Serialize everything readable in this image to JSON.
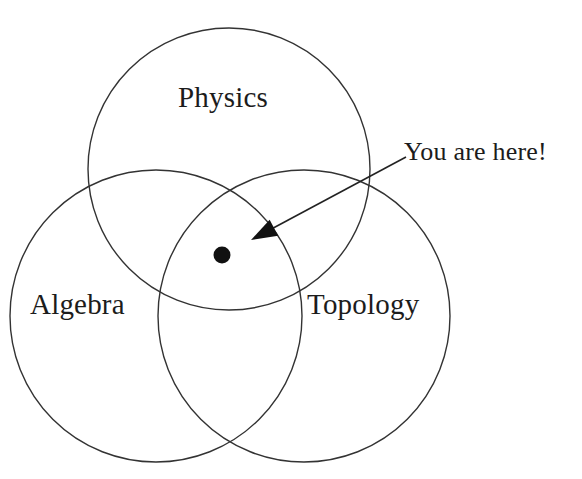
{
  "figure": {
    "type": "venn-diagram",
    "background_color": "#ffffff",
    "stroke_color": "#333333",
    "text_color": "#1c1c1c",
    "width": 582,
    "height": 479
  },
  "top_clipped_text": "",
  "circles": [
    {
      "id": "physics",
      "label": "Physics",
      "cx": 229,
      "cy": 169,
      "r": 141,
      "label_x": 178,
      "label_y": 83
    },
    {
      "id": "algebra",
      "label": "Algebra",
      "cx": 156,
      "cy": 316,
      "r": 146,
      "label_x": 30,
      "label_y": 290
    },
    {
      "id": "topology",
      "label": "Topology",
      "cx": 304,
      "cy": 316,
      "r": 146,
      "label_x": 307,
      "label_y": 290
    }
  ],
  "marker": {
    "name": "you-are-here-dot",
    "cx": 222,
    "cy": 255,
    "r": 8.5,
    "fill": "#111111"
  },
  "annotation": {
    "text": "You are here!",
    "text_x": 404,
    "text_y": 139,
    "arrow_tail_x": 406,
    "arrow_tail_y": 157,
    "arrow_tip_x": 251,
    "arrow_tip_y": 240
  }
}
